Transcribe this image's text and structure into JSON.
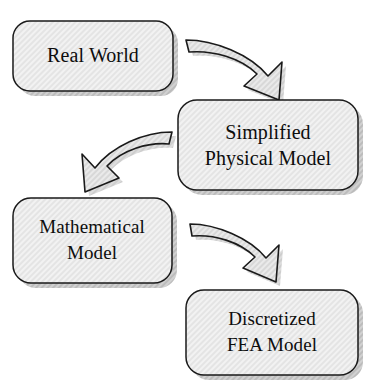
{
  "diagram": {
    "type": "flow-diagram",
    "background_color": "#ffffff",
    "box_fill_color": "#ededed",
    "box_border_color": "#1a1a1a",
    "box_shadow_color": "#9a9a9a",
    "arrow_fill_color": "#e3e3e3",
    "arrow_border_color": "#1a1a1a",
    "text_color": "#0d0d0d",
    "nodes": [
      {
        "id": "real-world",
        "lines": [
          "Real World"
        ],
        "x": 13,
        "y": 21,
        "width": 160,
        "height": 70
      },
      {
        "id": "simplified-physical-model",
        "lines": [
          "Simplified",
          "Physical Model"
        ],
        "x": 178,
        "y": 100,
        "width": 180,
        "height": 90
      },
      {
        "id": "mathematical-model",
        "lines": [
          "Mathematical",
          "Model"
        ],
        "x": 13,
        "y": 198,
        "width": 159,
        "height": 85
      },
      {
        "id": "discretized-fea-model",
        "lines": [
          "Discretized",
          "FEA Model"
        ],
        "x": 186,
        "y": 290,
        "width": 172,
        "height": 85
      }
    ],
    "arrows": [
      {
        "id": "arrow-real-world-to-simplified",
        "from": "real-world",
        "to": "simplified-physical-model",
        "direction": "down-right"
      },
      {
        "id": "arrow-simplified-to-mathematical",
        "from": "simplified-physical-model",
        "to": "mathematical-model",
        "direction": "down-left"
      },
      {
        "id": "arrow-mathematical-to-discretized",
        "from": "mathematical-model",
        "to": "discretized-fea-model",
        "direction": "down-right"
      }
    ]
  }
}
